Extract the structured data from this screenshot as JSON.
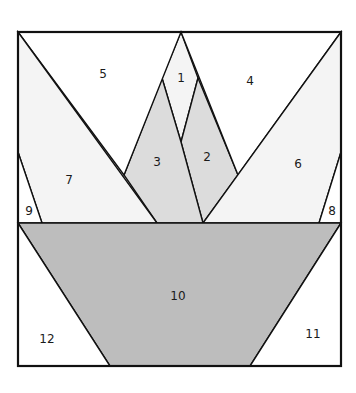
{
  "diagram": {
    "type": "foundation-paper-piecing-pattern",
    "colors": {
      "white": "#ffffff",
      "very_light": "#f4f4f4",
      "light": "#e2e2e2",
      "medium": "#bdbdbd",
      "stroke": "#111111"
    },
    "pieces": [
      {
        "id": "1",
        "label": "1",
        "fill": "#f4f4f4",
        "points": "181,32 198,78 181,142 162,78",
        "label_pos": [
          181,
          78
        ]
      },
      {
        "id": "2",
        "label": "2",
        "fill": "#dcdcdc",
        "points": "198,78 238,175 203,223 181,142",
        "label_pos": [
          207,
          157
        ]
      },
      {
        "id": "3",
        "label": "3",
        "fill": "#dcdcdc",
        "points": "162,78 181,142 203,223 157,223 124,175",
        "label_pos": [
          157,
          162
        ]
      },
      {
        "id": "4",
        "label": "4",
        "fill": "#ffffff",
        "points": "181,32 341,32 238,175",
        "label_pos": [
          250,
          81
        ]
      },
      {
        "id": "5",
        "label": "5",
        "fill": "#ffffff",
        "points": "18,32 181,32 124,175",
        "label_pos": [
          103,
          74
        ]
      },
      {
        "id": "6",
        "label": "6",
        "fill": "#f4f4f4",
        "points": "341,32 341,152 319,223 203,223",
        "label_pos": [
          298,
          164
        ]
      },
      {
        "id": "7",
        "label": "7",
        "fill": "#f4f4f4",
        "points": "18,32 157,223 42,223 18,152",
        "label_pos": [
          69,
          180
        ]
      },
      {
        "id": "8",
        "label": "8",
        "fill": "#ffffff",
        "points": "341,152 341,223 319,223",
        "label_pos": [
          332,
          211
        ]
      },
      {
        "id": "9",
        "label": "9",
        "fill": "#ffffff",
        "points": "18,152 42,223 18,223",
        "label_pos": [
          29,
          211
        ]
      },
      {
        "id": "10",
        "label": "10",
        "fill": "#bdbdbd",
        "points": "18,223 341,223 250,366 110,366",
        "label_pos": [
          178,
          296
        ]
      },
      {
        "id": "11",
        "label": "11",
        "fill": "#ffffff",
        "points": "341,223 341,366 250,366",
        "label_pos": [
          313,
          334
        ]
      },
      {
        "id": "12",
        "label": "12",
        "fill": "#ffffff",
        "points": "18,223 110,366 18,366",
        "label_pos": [
          47,
          339
        ]
      }
    ],
    "frame": {
      "x": 18,
      "y": 32,
      "width": 323,
      "height": 334
    }
  }
}
